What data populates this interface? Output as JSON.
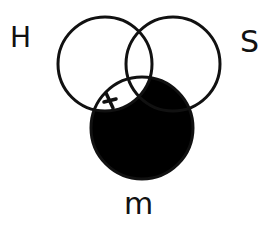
{
  "diagram": {
    "type": "venn-3",
    "circles": [
      {
        "id": "H",
        "label": "H",
        "cx": 105,
        "cy": 64,
        "r": 47
      },
      {
        "id": "S",
        "label": "S",
        "cx": 173,
        "cy": 64,
        "r": 47
      },
      {
        "id": "M",
        "label": "m",
        "cx": 142,
        "cy": 128,
        "r": 51
      }
    ],
    "shaded_regions": [
      "M not H"
    ],
    "marks": [
      {
        "symbol": "x",
        "region": "H and M not S",
        "x": 110,
        "y": 101
      }
    ],
    "colors": {
      "stroke": "#111111",
      "shade": "#000000",
      "background": "#ffffff"
    }
  },
  "labels": {
    "h": "H",
    "s": "S",
    "m": "m",
    "x_mark": "x"
  }
}
